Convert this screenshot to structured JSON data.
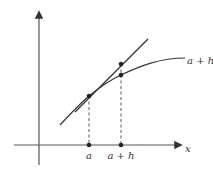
{
  "diagram": {
    "title": "",
    "axes": {
      "x_label": "x",
      "y_label": ""
    },
    "points": {
      "a_label": "a",
      "a_plus_h_label": "a + h"
    },
    "curve_label": "a + h",
    "colors": {
      "stroke": "#333333",
      "axis": "#555555",
      "background": "#ffffff"
    }
  }
}
